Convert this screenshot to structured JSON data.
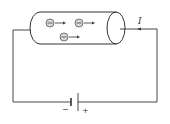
{
  "diagram": {
    "current_label": "I",
    "battery": {
      "negative_label": "−",
      "positive_label": "+"
    },
    "electron_symbol": "−",
    "electron_count": 3,
    "colors": {
      "line": "#333333",
      "electron_fill": "#d9d9d9",
      "background": "#ffffff"
    }
  }
}
